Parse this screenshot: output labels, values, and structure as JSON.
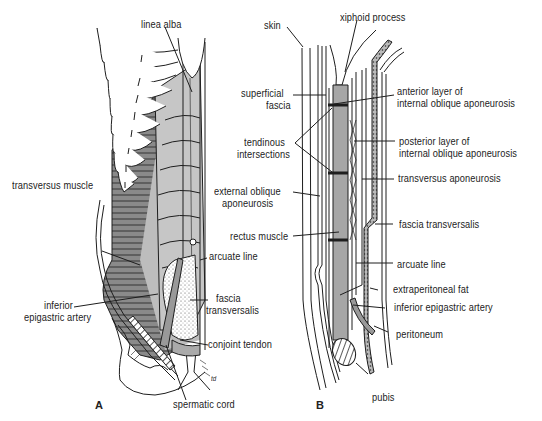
{
  "figure": {
    "panels": [
      {
        "id": "A",
        "letter": "A",
        "labels": {
          "linea_alba": "linea alba",
          "transversus_muscle": "transversus muscle",
          "arcuate_line": "arcuate line",
          "inferior_epigastric_artery_1": "inferior",
          "inferior_epigastric_artery_2": "epigastric artery",
          "fascia_transversalis_1": "fascia",
          "fascia_transversalis_2": "transversalis",
          "conjoint_tendon": "conjoint tendon",
          "spermatic_cord": "spermatic cord",
          "signature": "td"
        }
      },
      {
        "id": "B",
        "letter": "B",
        "labels": {
          "skin": "skin",
          "xiphoid_process": "xiphoid process",
          "superficial_fascia_1": "superficial",
          "superficial_fascia_2": "fascia",
          "tendinous_intersections_1": "tendinous",
          "tendinous_intersections_2": "intersections",
          "external_oblique_aponeurosis_1": "external oblique",
          "external_oblique_aponeurosis_2": "aponeurosis",
          "rectus_muscle": "rectus muscle",
          "anterior_layer_1": "anterior layer of",
          "anterior_layer_2": "internal oblique aponeurosis",
          "posterior_layer_1": "posterior layer of",
          "posterior_layer_2": "internal oblique aponeurosis",
          "transversus_aponeurosis": "transversus aponeurosis",
          "fascia_transversalis": "fascia transversalis",
          "arcuate_line": "arcuate line",
          "extraperitoneal_fat": "extraperitoneal fat",
          "inferior_epigastric_artery": "inferior epigastric artery",
          "peritoneum": "peritoneum",
          "pubis": "pubis"
        }
      }
    ],
    "colors": {
      "line": "#1e1e1e",
      "muscle_dark": "#8c8c8c",
      "muscle_light": "#c4c4c4",
      "rectus": "#a8a8a8",
      "background": "#ffffff"
    }
  }
}
